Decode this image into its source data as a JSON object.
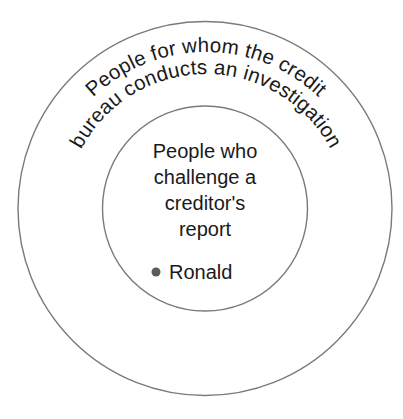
{
  "diagram": {
    "type": "nested-circles-venn",
    "background_color": "#ffffff",
    "outline_color": "#7a7a7a",
    "text_color": "#1a1a1a",
    "bullet_color": "#5b5b5b",
    "outer_set": {
      "label_line_1": "People for whom the credit",
      "label_line_2": "bureau conducts an investigation"
    },
    "inner_set": {
      "label_line_1": "People who",
      "label_line_2": "challenge a",
      "label_line_3": "creditor's",
      "label_line_4": "report",
      "members": [
        {
          "bullet": "•",
          "name": "Ronald"
        }
      ]
    }
  }
}
